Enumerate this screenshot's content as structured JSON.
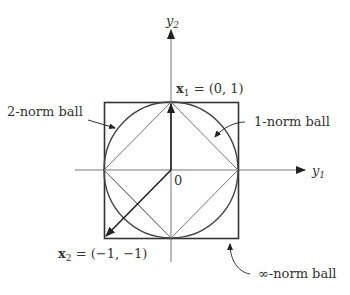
{
  "figure": {
    "axes": {
      "x_label": "y",
      "x_sub": "1",
      "y_label": "y",
      "y_sub": "2",
      "origin_label": "0"
    },
    "points": [
      {
        "name": "x",
        "sub": "1",
        "value": "= (0, 1)"
      },
      {
        "name": "x",
        "sub": "2",
        "value": "= (−1, −1)"
      }
    ],
    "annotations": {
      "two_norm": "2-norm ball",
      "one_norm": "1-norm ball",
      "inf_norm": "∞-norm ball"
    },
    "colors": {
      "stroke": "#333333",
      "thin": "#777777"
    }
  }
}
